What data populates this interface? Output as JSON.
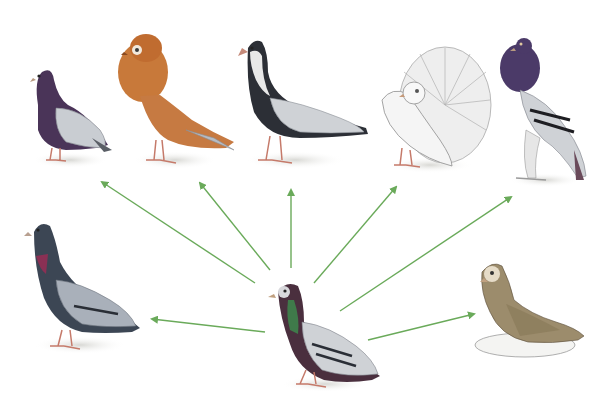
{
  "image": {
    "title": "Pigeon breeds descended from the rock dove",
    "width": 613,
    "height": 413,
    "background": "#ffffff",
    "arrow_color": "#6aaa5a"
  },
  "ancestor": {
    "name": "rock-dove",
    "position": [
      325,
      330
    ]
  },
  "breeds": [
    {
      "name": "purple-pigeon",
      "position": [
        68,
        115
      ]
    },
    {
      "name": "pouter-orange",
      "position": [
        165,
        110
      ]
    },
    {
      "name": "magpie-pigeon",
      "position": [
        285,
        110
      ]
    },
    {
      "name": "fantail-white",
      "position": [
        430,
        110
      ]
    },
    {
      "name": "pouter-tall-purple",
      "position": [
        545,
        110
      ]
    },
    {
      "name": "homing-pigeon",
      "position": [
        80,
        285
      ]
    },
    {
      "name": "frillback-brown",
      "position": [
        530,
        310
      ]
    }
  ],
  "arrows": [
    {
      "from": [
        255,
        283
      ],
      "to": [
        102,
        182
      ]
    },
    {
      "from": [
        270,
        270
      ],
      "to": [
        200,
        183
      ]
    },
    {
      "from": [
        291,
        268
      ],
      "to": [
        291,
        190
      ]
    },
    {
      "from": [
        314,
        283
      ],
      "to": [
        396,
        187
      ]
    },
    {
      "from": [
        340,
        311
      ],
      "to": [
        511,
        197
      ]
    },
    {
      "from": [
        368,
        340
      ],
      "to": [
        474,
        314
      ]
    },
    {
      "from": [
        265,
        332
      ],
      "to": [
        152,
        319
      ]
    }
  ]
}
